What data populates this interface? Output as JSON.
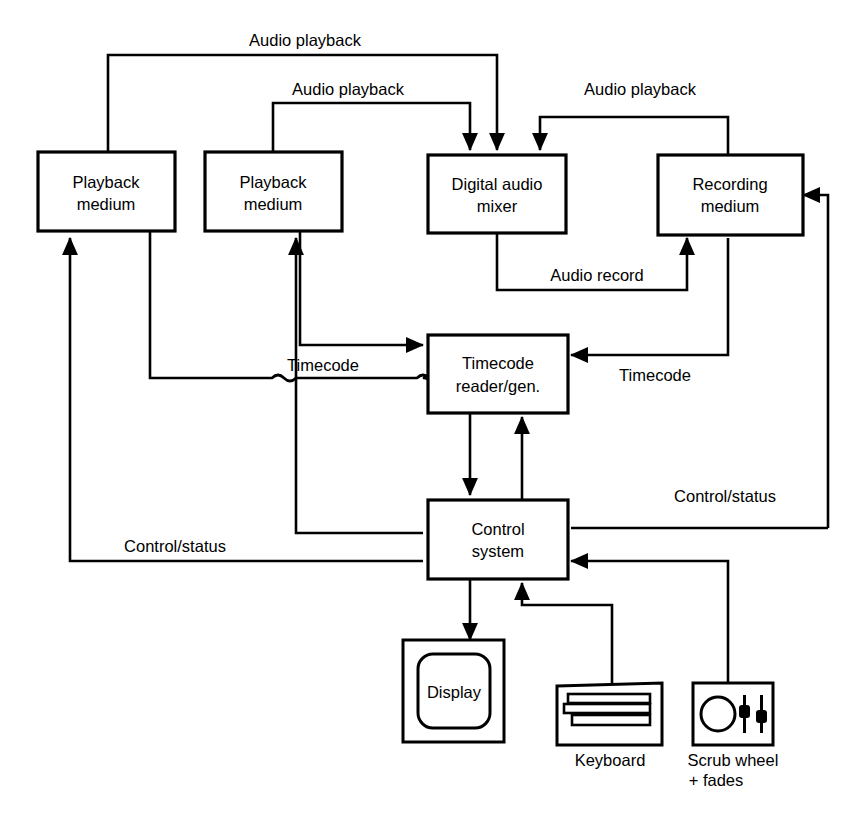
{
  "figure": {
    "domain": "diagram",
    "type": "block-diagram",
    "background": "#ffffff",
    "line_color": "#000000",
    "caption": ""
  },
  "blocks": [
    {
      "id": "playback1",
      "label_line1": "Playback",
      "label_line2": "medium"
    },
    {
      "id": "playback2",
      "label_line1": "Playback",
      "label_line2": "medium"
    },
    {
      "id": "mixer",
      "label_line1": "Digital audio",
      "label_line2": "mixer"
    },
    {
      "id": "recording",
      "label_line1": "Recording",
      "label_line2": "medium"
    },
    {
      "id": "timecode",
      "label_line1": "Timecode",
      "label_line2": "reader/gen."
    },
    {
      "id": "control",
      "label_line1": "Control",
      "label_line2": "system"
    }
  ],
  "devices": [
    {
      "id": "display",
      "inner_label": "Display",
      "caption_line1": "",
      "caption_line2": ""
    },
    {
      "id": "keyboard",
      "inner_label": "",
      "caption_line1": "Keyboard",
      "caption_line2": ""
    },
    {
      "id": "scrub",
      "inner_label": "",
      "caption_line1": "Scrub wheel",
      "caption_line2": "+ fades"
    }
  ],
  "edge_labels": {
    "audio_playback_1": "Audio playback",
    "audio_playback_2": "Audio playback",
    "audio_playback_3": "Audio playback",
    "audio_record": "Audio record",
    "timecode_left": "Timecode",
    "timecode_right": "Timecode",
    "control_status_left": "Control/status",
    "control_status_right": "Control/status"
  },
  "connections": [
    {
      "from": "playback1",
      "to": "mixer",
      "label": "Audio playback"
    },
    {
      "from": "playback2",
      "to": "mixer",
      "label": "Audio playback"
    },
    {
      "from": "recording",
      "to": "mixer",
      "label": "Audio playback"
    },
    {
      "from": "mixer",
      "to": "recording",
      "label": "Audio record"
    },
    {
      "from": "playback1",
      "to": "timecode",
      "label": "Timecode"
    },
    {
      "from": "playback2",
      "to": "timecode",
      "label": "Timecode"
    },
    {
      "from": "recording",
      "to": "timecode",
      "label": "Timecode"
    },
    {
      "from": "timecode",
      "to": "control",
      "label": ""
    },
    {
      "from": "control",
      "to": "timecode",
      "label": ""
    },
    {
      "from": "control",
      "to": "playback1",
      "label": "Control/status"
    },
    {
      "from": "control",
      "to": "playback2",
      "label": "Control/status"
    },
    {
      "from": "control",
      "to": "recording",
      "label": "Control/status"
    },
    {
      "from": "control",
      "to": "display",
      "label": ""
    },
    {
      "from": "keyboard",
      "to": "control",
      "label": ""
    },
    {
      "from": "scrub",
      "to": "control",
      "label": ""
    }
  ]
}
